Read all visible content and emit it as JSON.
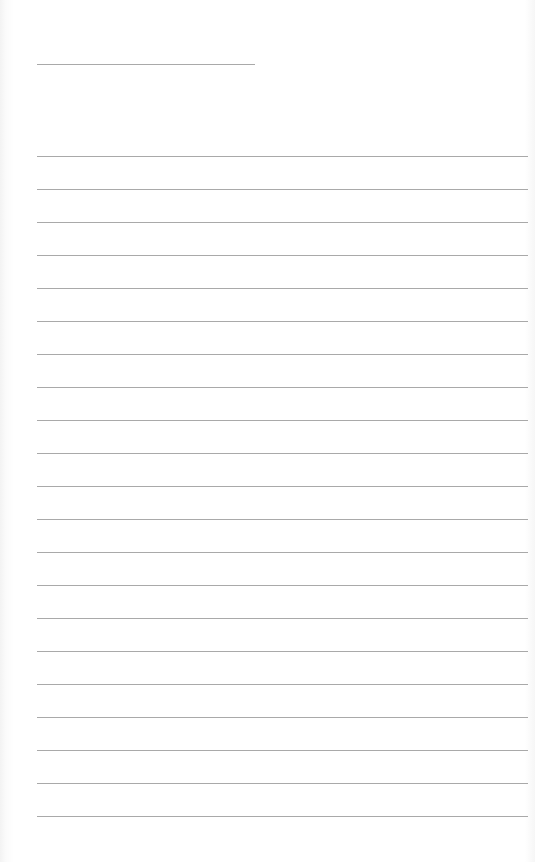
{
  "page": {
    "type": "lined-paper",
    "background_color": "#ffffff",
    "line_color": "#8c8c8c"
  },
  "header_line": {
    "x": 37,
    "y": 64,
    "width": 218
  },
  "rules": {
    "x": 37,
    "width": 491,
    "first_y": 156,
    "spacing": 33,
    "count": 21
  }
}
